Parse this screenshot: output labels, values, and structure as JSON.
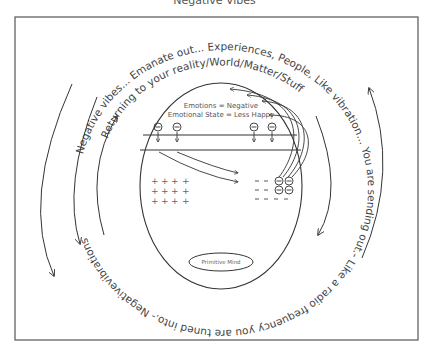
{
  "title": "Negative Vibes",
  "outer_text": {
    "top_arc": "Negative vibes... Emanate out... Experiences, People, Like vibration... You are sending out.- Like a radio frequency you are tuned into.- Negativevibrations",
    "inner_arc": "Returning to your reality/World/Matter/Stuff"
  },
  "mind": {
    "line1": "Emotions = Negative",
    "line2": "Emotional State = Less Happy",
    "negative_symbol": "⊖",
    "positive_symbol": "+",
    "dash_symbol": "–",
    "primitive_mind": "Primitive Mind"
  },
  "colors": {
    "stroke": "#333333",
    "text": "#444444",
    "frame": "#555555"
  }
}
